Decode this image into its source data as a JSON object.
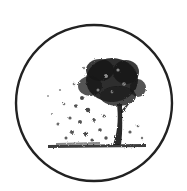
{
  "emblem": {
    "shape": "circle",
    "subject": "tree-icon",
    "description": "Circular emblem with an ink-stippled tree shedding leaves onto the ground",
    "colors": {
      "background": "#ffffff",
      "ink": "#1a1a1a",
      "ring": "#222222"
    }
  }
}
